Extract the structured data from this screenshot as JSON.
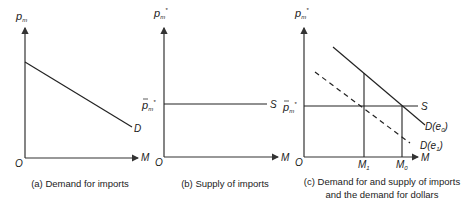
{
  "panels": [
    {
      "id": "a",
      "y_axis_label": "p",
      "y_axis_sub": "m",
      "x_axis_label": "M",
      "origin_label": "O",
      "curve_label": "D",
      "caption": "(a) Demand for imports"
    },
    {
      "id": "b",
      "y_axis_label": "p",
      "y_axis_sub": "m",
      "y_axis_sup": "*",
      "x_axis_label": "M",
      "origin_label": "O",
      "level_label": "p",
      "level_sub": "m",
      "level_sup": "*",
      "curve_label": "S",
      "caption": "(b) Supply of imports"
    },
    {
      "id": "c",
      "y_axis_label": "p",
      "y_axis_sub": "m",
      "y_axis_sup": "*",
      "x_axis_label": "M",
      "origin_label": "O",
      "level_label": "p",
      "level_sub": "m",
      "level_sup": "*",
      "supply_label": "S",
      "demand0_label": "D(e",
      "demand0_sub": "0",
      "demand1_label": "D(e",
      "demand1_sub": "1",
      "close_paren": ")",
      "m1_label": "M",
      "m1_sub": "1",
      "m0_label": "M",
      "m0_sub": "0",
      "caption_line1": "(c) Demand for and supply of imports",
      "caption_line2": "and the demand for dollars"
    }
  ],
  "colors": {
    "line": "#222222",
    "axis": "#333333"
  }
}
